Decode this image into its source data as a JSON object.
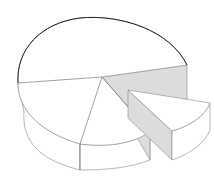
{
  "figure": {
    "colors": {
      "background": "#ffffff",
      "outline": "#777777",
      "rim": "#222222",
      "cut_face_shading": "#d8d8d8"
    },
    "slices": [
      {
        "name": "back-slice"
      },
      {
        "name": "left-front-slice"
      },
      {
        "name": "front-slice"
      },
      {
        "name": "exploded-slice",
        "exploded": true
      }
    ]
  }
}
